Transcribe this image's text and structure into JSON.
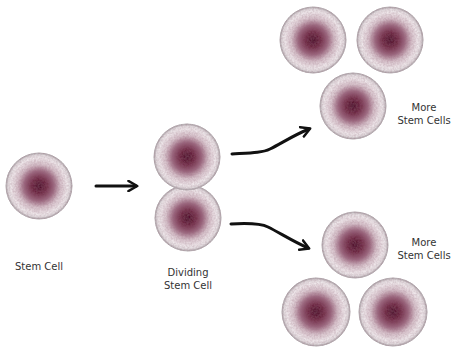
{
  "colors": {
    "background": "#ffffff",
    "cell_outer": "#f4eff1",
    "cell_rim": "#a9a2a6",
    "cell_mid": "#c9a9b6",
    "nucleus": "#6e2a43",
    "nucleus_dark": "#4a1028",
    "arrow": "#111111",
    "text": "#333333"
  },
  "stages": [
    {
      "id": "stem-cell",
      "label_lines": [
        "Stem Cell"
      ],
      "cell_count": 1
    },
    {
      "id": "dividing-stem-cell",
      "label_lines": [
        "Dividing",
        "Stem Cell"
      ],
      "cell_count": 2
    },
    {
      "id": "more-stem-cells-top",
      "label_lines": [
        "More",
        "Stem Cells"
      ],
      "cell_count": 3
    },
    {
      "id": "more-stem-cells-bottom",
      "label_lines": [
        "More",
        "Stem Cells"
      ],
      "cell_count": 3
    }
  ],
  "arrows": [
    {
      "from": "stem-cell",
      "to": "dividing-stem-cell"
    },
    {
      "from": "dividing-stem-cell",
      "to": "more-stem-cells-top"
    },
    {
      "from": "dividing-stem-cell",
      "to": "more-stem-cells-bottom"
    }
  ]
}
